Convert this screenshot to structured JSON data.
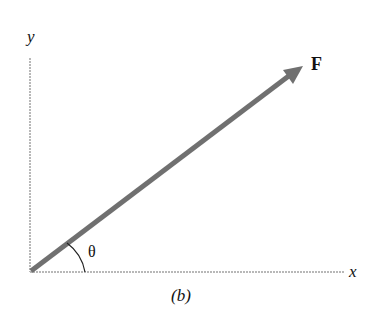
{
  "diagram": {
    "axes": {
      "x_label": "x",
      "y_label": "y"
    },
    "vector": {
      "label": "F",
      "color": "#707070"
    },
    "angle": {
      "label": "θ"
    },
    "caption": "(b)",
    "colors": {
      "axis": "#b8b8b8",
      "vector": "#707070",
      "text": "#111111"
    }
  }
}
